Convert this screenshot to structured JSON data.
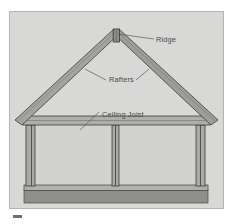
{
  "diagram": {
    "background_color": "#d8d8d6",
    "frame_color": "#b4b4b4",
    "timber_fill": "#a9a9a6",
    "timber_edge": "#3e3e3e",
    "foundation_color": "#8e8e8b",
    "label_color": "#4a4a4a",
    "labels": [
      {
        "id": "ridge",
        "text": "Ridge",
        "x": 146,
        "y": 30
      },
      {
        "id": "rafters",
        "text": "Rafters",
        "x": 99,
        "y": 70
      },
      {
        "id": "ceiling-joist",
        "text": "Ceiling Joist",
        "x": 92,
        "y": 105
      }
    ],
    "components": [
      "ridge-board",
      "left-rafter",
      "right-rafter",
      "ceiling-joist-beam",
      "left-wall",
      "right-wall",
      "center-post",
      "floor-beam",
      "foundation"
    ]
  }
}
